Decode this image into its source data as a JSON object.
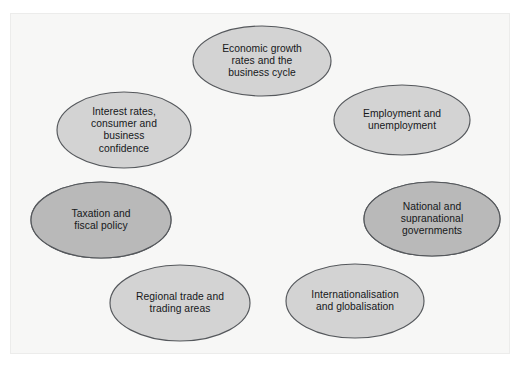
{
  "figure": {
    "type": "ring-diagram",
    "shape": "ellipse-cycle",
    "node_count": 7,
    "background_color": "#f7f7f6",
    "frame_color": "#ececeb",
    "ellipse_fill": "#d3d3d3",
    "ellipse_fill_highlight": "#b9b9b9",
    "ellipse_stroke": "#55585c",
    "text_color": "#16181a"
  },
  "ghost_text": {
    "top": "",
    "bottom_line1": "",
    "bottom_line2": ""
  },
  "nodes": [
    {
      "id": "economic-growth",
      "label": "Economic growth\nrates and the\nbusiness cycle",
      "cx": 252,
      "cy": 48,
      "rx": 69,
      "ry": 35,
      "highlight": false
    },
    {
      "id": "employment",
      "label": "Employment and\nunemployment",
      "cx": 392,
      "cy": 107,
      "rx": 68,
      "ry": 35,
      "highlight": false
    },
    {
      "id": "governments",
      "label": "National and\nsupranational\ngovernments",
      "cx": 422,
      "cy": 206,
      "rx": 68,
      "ry": 37,
      "highlight": true
    },
    {
      "id": "globalisation",
      "label": "Internationalisation\nand globalisation",
      "cx": 345,
      "cy": 288,
      "rx": 69,
      "ry": 37,
      "highlight": false
    },
    {
      "id": "regional-trade",
      "label": "Regional trade and\ntrading areas",
      "cx": 170,
      "cy": 290,
      "rx": 70,
      "ry": 38,
      "highlight": false
    },
    {
      "id": "taxation",
      "label": "Taxation and\nfiscal policy",
      "cx": 91,
      "cy": 207,
      "rx": 70,
      "ry": 38,
      "highlight": true
    },
    {
      "id": "interest-rates",
      "label": "Interest rates,\nconsumer and\nbusiness\nconfidence",
      "cx": 114,
      "cy": 117,
      "rx": 67,
      "ry": 38,
      "highlight": false
    }
  ]
}
